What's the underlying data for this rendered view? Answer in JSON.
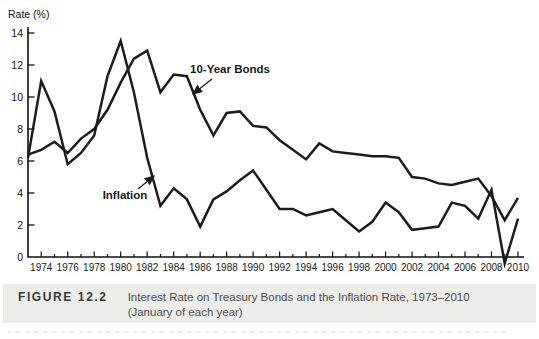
{
  "figure": {
    "caption_label": "FIGURE 12.2",
    "caption_line1": "Interest Rate on Treasury Bonds and the Inflation Rate, 1973–2010",
    "caption_line2": "(January of each year)"
  },
  "chart_data": {
    "type": "line",
    "title": "",
    "ylabel": "Rate (%)",
    "xlabel": "",
    "ylim": [
      0,
      14
    ],
    "y_ticks": [
      0,
      2,
      4,
      6,
      8,
      10,
      12,
      14
    ],
    "grid": false,
    "legend_position": "inline-annotations",
    "line_color": "#1c1c1c",
    "x": [
      1973,
      1974,
      1975,
      1976,
      1977,
      1978,
      1979,
      1980,
      1981,
      1982,
      1983,
      1984,
      1985,
      1986,
      1987,
      1988,
      1989,
      1990,
      1991,
      1992,
      1993,
      1994,
      1995,
      1996,
      1997,
      1998,
      1999,
      2000,
      2001,
      2002,
      2003,
      2004,
      2005,
      2006,
      2007,
      2008,
      2009,
      2010
    ],
    "x_tick_labels": [
      "1974",
      "1976",
      "1978",
      "1980",
      "1982",
      "1984",
      "1986",
      "1988",
      "1990",
      "1992",
      "1994",
      "1996",
      "1998",
      "2000",
      "2002",
      "2004",
      "2006",
      "2008",
      "2010"
    ],
    "series": [
      {
        "name": "10-Year Bonds",
        "values": [
          6.4,
          6.7,
          7.2,
          6.5,
          7.4,
          8.0,
          9.2,
          10.9,
          12.4,
          12.9,
          10.3,
          11.4,
          11.3,
          9.2,
          7.6,
          9.0,
          9.1,
          8.2,
          8.1,
          7.3,
          6.7,
          6.1,
          7.1,
          6.6,
          6.5,
          6.4,
          6.3,
          6.3,
          6.2,
          5.0,
          4.9,
          4.6,
          4.5,
          4.7,
          4.9,
          3.8,
          2.3,
          3.7
        ]
      },
      {
        "name": "Inflation",
        "values": [
          6.2,
          11.0,
          9.1,
          5.8,
          6.5,
          7.6,
          11.3,
          13.5,
          10.3,
          6.2,
          3.2,
          4.3,
          3.6,
          1.9,
          3.6,
          4.1,
          4.8,
          5.4,
          4.2,
          3.0,
          3.0,
          2.6,
          2.8,
          3.0,
          2.3,
          1.6,
          2.2,
          3.4,
          2.8,
          1.7,
          1.8,
          1.9,
          3.4,
          3.2,
          2.4,
          4.2,
          -0.4,
          2.4
        ]
      }
    ],
    "annotations": [
      {
        "text": "10-Year Bonds",
        "label_x": 230,
        "label_y": 73,
        "arrow": [
          212,
          79,
          193,
          94
        ]
      },
      {
        "text": "Inflation",
        "label_x": 125,
        "label_y": 199,
        "arrow": [
          138,
          189,
          154,
          176
        ]
      }
    ]
  }
}
